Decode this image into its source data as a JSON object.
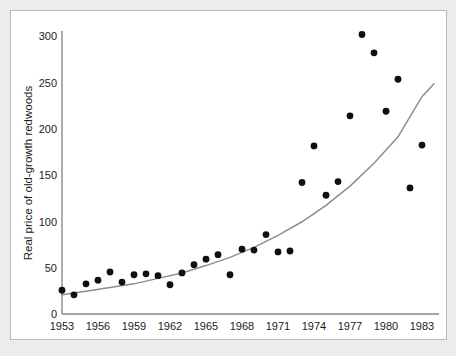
{
  "figure": {
    "background_color": "#ececed",
    "panel_color": "#ffffff",
    "panel_border_color": "#b9b9b9",
    "axis_color": "#8a8a8a",
    "point_color": "#101010",
    "curve_color": "#8d8d8d"
  },
  "chart_data": {
    "type": "scatter",
    "title": "",
    "xlabel": "",
    "ylabel": "Real price of old-growth redwoods",
    "xlim": [
      1952.3,
      1984.5
    ],
    "ylim": [
      0,
      312
    ],
    "grid": false,
    "legend": null,
    "xticks": [
      1953,
      1956,
      1959,
      1962,
      1965,
      1968,
      1971,
      1974,
      1977,
      1980,
      1983
    ],
    "xtick_labels": [
      "1953",
      "1956",
      "1959",
      "1962",
      "1965",
      "1968",
      "1971",
      "1974",
      "1977",
      "1980",
      "1983"
    ],
    "yticks": [
      0,
      50,
      100,
      150,
      200,
      250,
      300
    ],
    "ytick_labels": [
      "0",
      "50",
      "100",
      "150",
      "200",
      "250",
      "300"
    ],
    "x": [
      1953,
      1954,
      1955,
      1956,
      1957,
      1958,
      1959,
      1960,
      1961,
      1962,
      1963,
      1964,
      1965,
      1966,
      1967,
      1968,
      1969,
      1970,
      1971,
      1972,
      1973,
      1974,
      1975,
      1976,
      1977,
      1978,
      1979,
      1980,
      1981,
      1982,
      1983
    ],
    "y": [
      26,
      21,
      33,
      37,
      46,
      35,
      43,
      44,
      42,
      32,
      45,
      54,
      60,
      65,
      43,
      71,
      70,
      87,
      68,
      69,
      144,
      184,
      130,
      145,
      217,
      306,
      286,
      222,
      257,
      138,
      185
    ],
    "points": [
      {
        "x": 1953,
        "y": 26
      },
      {
        "x": 1954,
        "y": 21
      },
      {
        "x": 1955,
        "y": 33
      },
      {
        "x": 1956,
        "y": 37
      },
      {
        "x": 1957,
        "y": 46
      },
      {
        "x": 1958,
        "y": 35
      },
      {
        "x": 1959,
        "y": 43
      },
      {
        "x": 1960,
        "y": 44
      },
      {
        "x": 1961,
        "y": 42
      },
      {
        "x": 1962,
        "y": 32
      },
      {
        "x": 1963,
        "y": 45
      },
      {
        "x": 1964,
        "y": 54
      },
      {
        "x": 1965,
        "y": 60
      },
      {
        "x": 1966,
        "y": 65
      },
      {
        "x": 1967,
        "y": 43
      },
      {
        "x": 1968,
        "y": 71
      },
      {
        "x": 1969,
        "y": 70
      },
      {
        "x": 1970,
        "y": 87
      },
      {
        "x": 1971,
        "y": 68
      },
      {
        "x": 1972,
        "y": 69
      },
      {
        "x": 1973,
        "y": 144
      },
      {
        "x": 1974,
        "y": 184
      },
      {
        "x": 1975,
        "y": 130
      },
      {
        "x": 1976,
        "y": 145
      },
      {
        "x": 1977,
        "y": 217
      },
      {
        "x": 1978,
        "y": 306
      },
      {
        "x": 1979,
        "y": 286
      },
      {
        "x": 1980,
        "y": 222
      },
      {
        "x": 1981,
        "y": 257
      },
      {
        "x": 1982,
        "y": 138
      },
      {
        "x": 1983,
        "y": 185
      }
    ],
    "fit_curve": {
      "name": "exponential trend",
      "x": [
        1953,
        1955,
        1957,
        1959,
        1961,
        1963,
        1965,
        1967,
        1969,
        1971,
        1973,
        1975,
        1977,
        1979,
        1981,
        1983,
        1984
      ],
      "y": [
        21,
        25,
        29,
        33,
        39,
        45,
        53,
        62,
        73,
        86,
        101,
        119,
        140,
        165,
        194,
        238,
        252
      ]
    }
  }
}
